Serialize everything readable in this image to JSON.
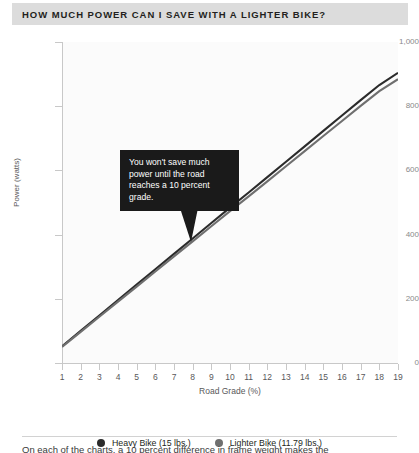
{
  "title": "HOW MUCH POWER CAN I SAVE WITH A LIGHTER BIKE?",
  "callout": {
    "text": "You won't save much power until the road reaches a 10 percent grade."
  },
  "footer": {
    "text": "On each of the charts, a 10 percent difference in frame weight makes the"
  },
  "legend": {
    "items": [
      {
        "label": "Heavy Bike (15 lbs.)",
        "color": "#2b2b2b",
        "marker": "circle-dot"
      },
      {
        "label": "Lighter Bike (11.79 lbs.)",
        "color": "#6f6f6f",
        "marker": "circle-dot"
      }
    ]
  },
  "chart_data": {
    "type": "line",
    "title": "HOW MUCH POWER CAN I SAVE WITH A LIGHTER BIKE?",
    "xlabel": "Road Grade (%)",
    "ylabel": "Power (watts)",
    "xlim": [
      1,
      19
    ],
    "ylim": [
      0,
      1000
    ],
    "grid": false,
    "legend_position": "bottom-center",
    "x": [
      1,
      2,
      3,
      4,
      5,
      6,
      7,
      8,
      9,
      10,
      11,
      12,
      13,
      14,
      15,
      16,
      17,
      18,
      19
    ],
    "xticklabels": [
      "1",
      "2",
      "3",
      "4",
      "5",
      "6",
      "7",
      "8",
      "9",
      "10",
      "11",
      "12",
      "13",
      "14",
      "15",
      "16",
      "17",
      "18",
      "19"
    ],
    "yticks": [
      0,
      200,
      400,
      600,
      800,
      1000
    ],
    "yticklabels": [
      "0",
      "200",
      "400",
      "600",
      "800",
      "1,000"
    ],
    "series": [
      {
        "name": "Heavy Bike (15 lbs.)",
        "color": "#2b2b2b",
        "values": [
          52,
          100,
          148,
          196,
          244,
          292,
          340,
          388,
          436,
          484,
          531,
          579,
          627,
          675,
          723,
          771,
          819,
          866,
          904
        ]
      },
      {
        "name": "Lighter Bike (11.79 lbs.)",
        "color": "#6f6f6f",
        "values": [
          50,
          97,
          144,
          191,
          238,
          285,
          332,
          379,
          426,
          473,
          519,
          566,
          613,
          660,
          707,
          754,
          801,
          847,
          884
        ]
      }
    ],
    "annotations": [
      {
        "text": "You won't save much power until the road reaches a 10 percent grade.",
        "points_to_x": 10,
        "points_to_y": 484
      }
    ]
  }
}
